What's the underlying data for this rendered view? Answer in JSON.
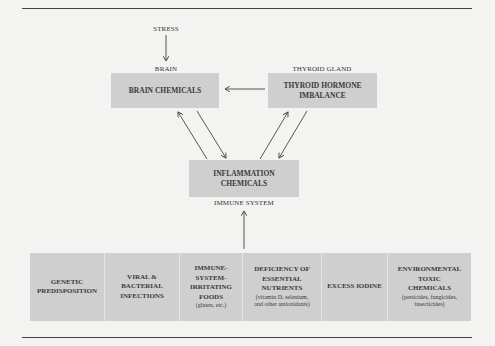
{
  "diagram": {
    "labels": {
      "stress": "STRESS",
      "brain": "BRAIN",
      "thyroid_gland": "THYROID GLAND",
      "immune_system": "IMMUNE SYSTEM"
    },
    "boxes": {
      "brain_chemicals": "BRAIN CHEMICALS",
      "thyroid_line1": "THYROID HORMONE",
      "thyroid_line2": "IMBALANCE",
      "inflammation_line1": "INFLAMMATION",
      "inflammation_line2": "CHEMICALS"
    },
    "factors": [
      {
        "lines": [
          "GENETIC",
          "PREDISPOSITION"
        ],
        "sub": []
      },
      {
        "lines": [
          "VIRAL &",
          "BACTERIAL",
          "INFECTIONS"
        ],
        "sub": []
      },
      {
        "lines": [
          "IMMUNE-",
          "SYSTEM-",
          "IRRITATING",
          "FOODS"
        ],
        "sub": [
          "(gluten, etc.)"
        ]
      },
      {
        "lines": [
          "DEFICIENCY OF",
          "ESSENTIAL",
          "NUTRIENTS"
        ],
        "sub": [
          "(vitamin D, selenium,",
          "and other antioxidants)"
        ]
      },
      {
        "lines": [
          "EXCESS IODINE"
        ],
        "sub": []
      },
      {
        "lines": [
          "ENVIRONMENTAL",
          "TOXIC",
          "CHEMICALS"
        ],
        "sub": [
          "(pesticides, fungicides,",
          "insecticides)"
        ]
      }
    ],
    "colors": {
      "box": "#cfcfcf",
      "background": "#f3f3f1",
      "line": "#444444"
    }
  }
}
